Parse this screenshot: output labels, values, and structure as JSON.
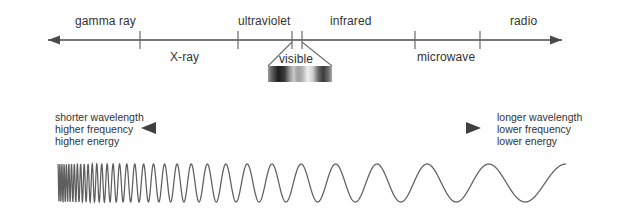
{
  "diagram": {
    "background_color": "#ffffff",
    "line_color": "#4a4a4a",
    "text_color": "#333333"
  },
  "spectrum_axis": {
    "bands_above": [
      {
        "label": "gamma ray",
        "x": 108,
        "y": 14
      },
      {
        "label": "ultraviolet",
        "x": 267,
        "y": 14
      },
      {
        "label": "infrared",
        "x": 355,
        "y": 14
      },
      {
        "label": "radio",
        "x": 530,
        "y": 14
      }
    ],
    "bands_below": [
      {
        "label": "X-ray",
        "x": 190,
        "y": 50
      },
      {
        "label": "microwave",
        "x": 448,
        "y": 50
      }
    ],
    "ticks": [
      140,
      238,
      292,
      302,
      415,
      480
    ]
  },
  "visible_callout": {
    "label": "visible",
    "label_x": 300,
    "label_y": 52,
    "bar": {
      "x": 268,
      "y": 66,
      "width": 64,
      "height": 16,
      "description": "grayscale-rendered visible spectrum band"
    }
  },
  "properties": {
    "left": {
      "lines": [
        "shorter wavelength",
        "higher frequency",
        "higher energy"
      ],
      "x": 55,
      "y": 112
    },
    "right": {
      "lines": [
        "longer wavelength",
        "lower frequency",
        "lower energy"
      ],
      "x": 497,
      "y": 112
    },
    "arrow": {
      "x1": 141,
      "x2": 481,
      "y": 128,
      "double_headed": true
    }
  },
  "waveform": {
    "description": "chirped sine wave, wavelength increasing left to right",
    "x_start": 58,
    "x_end": 566,
    "baseline_y": 183,
    "amplitude": 19,
    "cycles": 34
  },
  "chart_data": {
    "type": "line",
    "xlabel": "wavelength (increasing to the right)",
    "ylabel": "",
    "categories": [
      "gamma ray",
      "X-ray",
      "ultraviolet",
      "visible",
      "infrared",
      "microwave",
      "radio"
    ],
    "annotations": [
      "shorter wavelength",
      "higher frequency",
      "higher energy",
      "longer wavelength",
      "lower frequency",
      "lower energy"
    ],
    "grid": false,
    "legend": "none"
  }
}
